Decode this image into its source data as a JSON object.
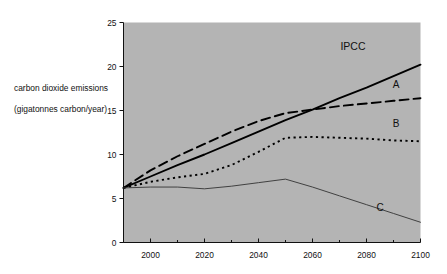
{
  "chart_data": {
    "type": "line",
    "title": "",
    "xlabel": "",
    "ylabel": "carbon dioxide emissions (gigatonnes carbon/year)",
    "ylabel_line1": "carbon dioxide emissions",
    "ylabel_line2": "(gigatonnes carbon/year)",
    "xlim": [
      1990,
      2100
    ],
    "ylim": [
      0,
      25
    ],
    "grid": false,
    "legend_position": "inline-right-of-curve-ends",
    "plot_background": "#b4b4b4",
    "x_ticks": [
      2000,
      2020,
      2040,
      2060,
      2080,
      2100
    ],
    "x_tick_labels": [
      "2000",
      "2020",
      "2040",
      "2060",
      "2080",
      "2100"
    ],
    "x_minor_ticks": [
      1990,
      2010,
      2030,
      2050,
      2070,
      2090
    ],
    "y_ticks": [
      0,
      5,
      10,
      15,
      20,
      25
    ],
    "y_tick_labels": [
      "0",
      "5",
      "10",
      "15",
      "20",
      "25"
    ],
    "series": [
      {
        "name": "IPCC",
        "label": "IPCC",
        "style": "solid",
        "color": "#000000",
        "width": 1.9,
        "x": [
          1990,
          2000,
          2010,
          2020,
          2030,
          2040,
          2050,
          2060,
          2070,
          2080,
          2090,
          2100
        ],
        "values": [
          6.2,
          7.5,
          8.8,
          10.0,
          11.3,
          12.6,
          13.9,
          15.1,
          16.4,
          17.6,
          18.9,
          20.2
        ]
      },
      {
        "name": "A",
        "label": "A",
        "style": "dashed",
        "color": "#000000",
        "width": 1.9,
        "x": [
          1990,
          2000,
          2010,
          2020,
          2030,
          2040,
          2050,
          2060,
          2070,
          2080,
          2090,
          2100
        ],
        "values": [
          6.2,
          8.2,
          9.8,
          11.2,
          12.6,
          13.8,
          14.7,
          15.1,
          15.5,
          15.8,
          16.1,
          16.4
        ]
      },
      {
        "name": "B",
        "label": "B",
        "style": "dotted",
        "color": "#000000",
        "width": 1.9,
        "x": [
          1990,
          2000,
          2010,
          2020,
          2030,
          2040,
          2050,
          2060,
          2070,
          2080,
          2090,
          2100
        ],
        "values": [
          6.2,
          6.9,
          7.4,
          7.8,
          8.8,
          10.3,
          11.9,
          12.0,
          11.9,
          11.8,
          11.6,
          11.5
        ]
      },
      {
        "name": "C",
        "label": "C",
        "style": "solid",
        "color": "#333333",
        "width": 0.9,
        "x": [
          1990,
          2000,
          2010,
          2020,
          2030,
          2040,
          2050,
          2060,
          2070,
          2080,
          2090,
          2100
        ],
        "values": [
          6.2,
          6.3,
          6.3,
          6.1,
          6.4,
          6.8,
          7.2,
          6.3,
          5.3,
          4.3,
          3.3,
          2.3
        ]
      }
    ],
    "annotations": [
      {
        "text": "IPCC",
        "x": 2075,
        "y": 21.9
      },
      {
        "text": "A",
        "x": 2091,
        "y": 17.6
      },
      {
        "text": "B",
        "x": 2091,
        "y": 13.1
      },
      {
        "text": "C",
        "x": 2085,
        "y": 3.6
      }
    ]
  }
}
